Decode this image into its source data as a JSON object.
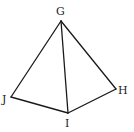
{
  "diagram": {
    "type": "triangular-pyramid",
    "colors": {
      "stroke": "#1a1a1a",
      "label": "#222222",
      "background": "#ffffff"
    },
    "vertices": [
      {
        "name": "G",
        "x": 61,
        "y": 21,
        "label_x": 56,
        "label_y": 15
      },
      {
        "name": "J",
        "x": 11,
        "y": 97,
        "label_x": 2,
        "label_y": 103
      },
      {
        "name": "I",
        "x": 68,
        "y": 113,
        "label_x": 65,
        "label_y": 127
      },
      {
        "name": "H",
        "x": 116,
        "y": 89,
        "label_x": 118,
        "label_y": 94
      }
    ],
    "edges": [
      [
        "G",
        "J"
      ],
      [
        "G",
        "I"
      ],
      [
        "G",
        "H"
      ],
      [
        "J",
        "I"
      ],
      [
        "I",
        "H"
      ]
    ]
  }
}
